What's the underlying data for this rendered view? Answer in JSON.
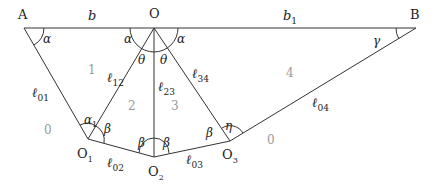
{
  "diagram": {
    "points": {
      "A": {
        "label": "A"
      },
      "O": {
        "label": "O"
      },
      "B": {
        "label": "B"
      },
      "O1": {
        "label": "O",
        "sub": "1"
      },
      "O2": {
        "label": "O",
        "sub": "2"
      },
      "O3": {
        "label": "O",
        "sub": "3"
      }
    },
    "segments": {
      "b": {
        "label": "b"
      },
      "b1": {
        "label": "b",
        "sub": "1"
      },
      "l01": {
        "label": "ℓ",
        "sub": "01"
      },
      "l12": {
        "label": "ℓ",
        "sub": "12"
      },
      "l23": {
        "label": "ℓ",
        "sub": "23"
      },
      "l34": {
        "label": "ℓ",
        "sub": "34"
      },
      "l02": {
        "label": "ℓ",
        "sub": "02"
      },
      "l03": {
        "label": "ℓ",
        "sub": "03"
      },
      "l04": {
        "label": "ℓ",
        "sub": "04"
      }
    },
    "angles": {
      "alpha_A": "α",
      "alpha_O_left": "α",
      "alpha_O_right": "α",
      "theta_left": "θ",
      "theta_right": "θ",
      "gamma": "γ",
      "alpha1": "α",
      "alpha1_sub": "1",
      "beta_O1": "β",
      "beta_O2_left": "β",
      "beta_O2_right": "β",
      "beta_O3": "β",
      "eta": "η"
    },
    "zones": {
      "z0_left": "0",
      "z1": "1",
      "z2": "2",
      "z3": "3",
      "z4": "4",
      "z0_right": "0"
    }
  }
}
